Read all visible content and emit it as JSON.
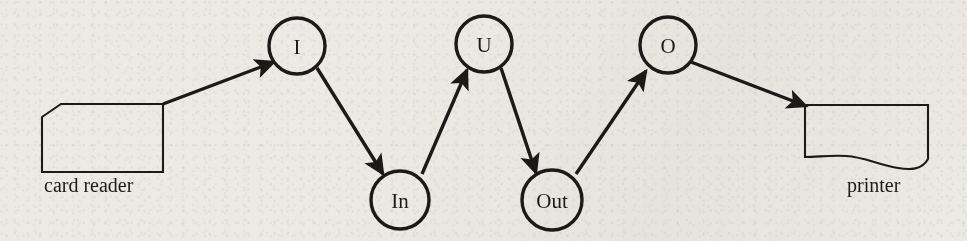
{
  "diagram": {
    "background_color": "#eceae4",
    "ink_color": "#1b1a18",
    "devices": [
      {
        "id": "card-reader",
        "label": "card reader",
        "shape": "punched-card",
        "x": 42,
        "y": 104,
        "width": 121,
        "height": 69,
        "label_x": 44,
        "label_y": 192
      },
      {
        "id": "printer",
        "label": "printer",
        "shape": "document-wavy-bottom",
        "x": 805,
        "y": 105,
        "width": 123,
        "height": 63,
        "label_x": 847,
        "label_y": 192
      }
    ],
    "nodes": [
      {
        "id": "I",
        "label": "I",
        "cx": 297,
        "cy": 46,
        "r": 28
      },
      {
        "id": "In",
        "label": "In",
        "cx": 400,
        "cy": 200,
        "r": 29
      },
      {
        "id": "U",
        "label": "U",
        "cx": 484,
        "cy": 44,
        "r": 28
      },
      {
        "id": "Out",
        "label": "Out",
        "cx": 552,
        "cy": 200,
        "r": 30
      },
      {
        "id": "O",
        "label": "O",
        "cx": 668,
        "cy": 45,
        "r": 28
      }
    ],
    "edges": [
      {
        "id": "edge-cardreader-I",
        "from": "card reader",
        "to": "I",
        "x1": 163,
        "y1": 104,
        "x2": 274,
        "y2": 62
      },
      {
        "id": "edge-I-In",
        "from": "I",
        "to": "In",
        "x1": 317,
        "y1": 68,
        "x2": 383,
        "y2": 174
      },
      {
        "id": "edge-In-U",
        "from": "In",
        "to": "U",
        "x1": 422,
        "y1": 174,
        "x2": 467,
        "y2": 70
      },
      {
        "id": "edge-U-Out",
        "from": "U",
        "to": "Out",
        "x1": 501,
        "y1": 68,
        "x2": 536,
        "y2": 173
      },
      {
        "id": "edge-Out-O",
        "from": "Out",
        "to": "O",
        "x1": 576,
        "y1": 174,
        "x2": 646,
        "y2": 71
      },
      {
        "id": "edge-O-printer",
        "from": "O",
        "to": "printer",
        "x1": 691,
        "y1": 62,
        "x2": 806,
        "y2": 106
      }
    ]
  }
}
